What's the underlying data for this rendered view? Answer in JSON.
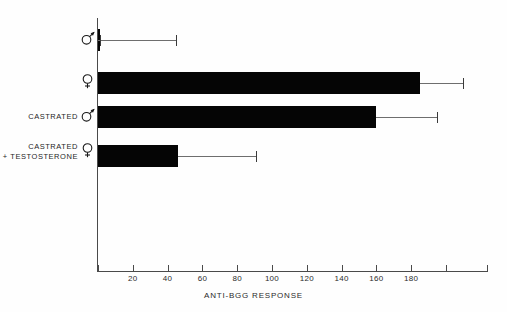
{
  "chart_data": {
    "type": "bar",
    "orientation": "horizontal",
    "title": "",
    "xlabel": "ANTI-BGG RESPONSE",
    "ylabel": "",
    "xlim": [
      0,
      224
    ],
    "xticks": [
      0,
      20,
      40,
      60,
      80,
      100,
      120,
      140,
      160,
      180,
      200
    ],
    "xtick_labels": [
      "",
      "20",
      "40",
      "60",
      "80",
      "100",
      "120",
      "140",
      "160",
      "180",
      ""
    ],
    "minor_tick_interval": 20,
    "grid": false,
    "legend": null,
    "categories": [
      "MALE",
      "FEMALE",
      "CASTRATED MALE",
      "CASTRATED FEMALE + TESTOSTERONE"
    ],
    "category_labels": [
      {
        "text": "",
        "symbol": "male",
        "symbol_char": "♂",
        "line2": ""
      },
      {
        "text": "",
        "symbol": "female",
        "symbol_char": "♀",
        "line2": ""
      },
      {
        "text": "CASTRATED",
        "symbol": "male",
        "symbol_char": "♂",
        "line2": ""
      },
      {
        "text": "CASTRATED",
        "symbol": "female",
        "symbol_char": "♀",
        "line2": "+ TESTOSTERONE"
      }
    ],
    "values": [
      0,
      185,
      160,
      46
    ],
    "error_upper": [
      45,
      210,
      195,
      91
    ],
    "bar_color": "#050505",
    "axis_color": "#4a4a4a",
    "error_color": "#6e6e6e"
  },
  "axis": {
    "x_title": "ANTI-BGG RESPONSE"
  }
}
